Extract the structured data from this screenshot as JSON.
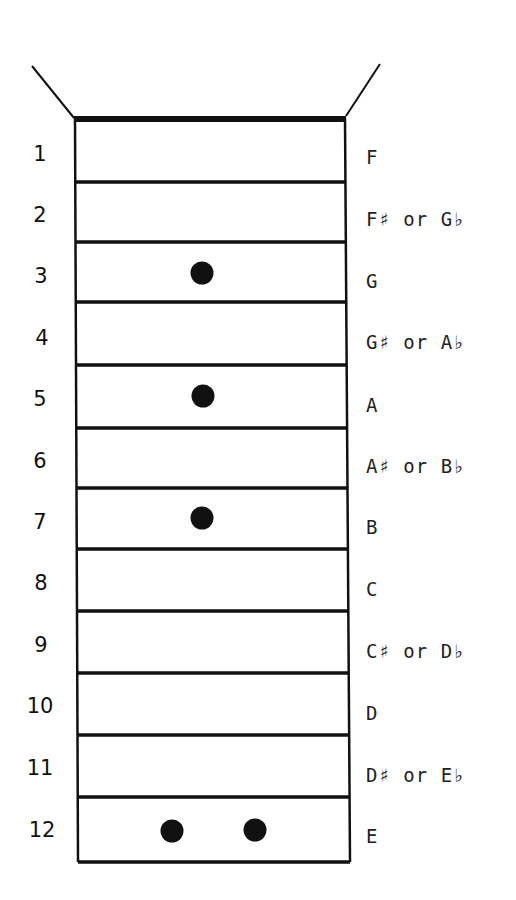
{
  "diagram": {
    "type": "guitar-fretboard-single-string",
    "frets": [
      {
        "number": "1",
        "note": "F",
        "markers": 0
      },
      {
        "number": "2",
        "note": "F♯ or G♭",
        "markers": 0
      },
      {
        "number": "3",
        "note": "G",
        "markers": 1
      },
      {
        "number": "4",
        "note": "G♯ or A♭",
        "markers": 0
      },
      {
        "number": "5",
        "note": "A",
        "markers": 1
      },
      {
        "number": "6",
        "note": "A♯ or B♭",
        "markers": 0
      },
      {
        "number": "7",
        "note": "B",
        "markers": 1
      },
      {
        "number": "8",
        "note": "C",
        "markers": 0
      },
      {
        "number": "9",
        "note": "C♯ or D♭",
        "markers": 0
      },
      {
        "number": "10",
        "note": "D",
        "markers": 0
      },
      {
        "number": "11",
        "note": "D♯ or E♭",
        "markers": 0
      },
      {
        "number": "12",
        "note": "E",
        "markers": 2
      }
    ],
    "colors": {
      "line": "#111111",
      "background": "#ffffff"
    }
  }
}
